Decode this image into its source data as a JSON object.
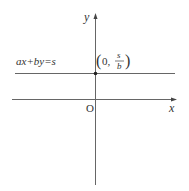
{
  "diagram": {
    "axes": {
      "x_label": "x",
      "y_label": "y",
      "origin_label": "O"
    },
    "line": {
      "equation": "ax+by=s",
      "orientation": "horizontal"
    },
    "point": {
      "open": "(0,",
      "numerator": "s",
      "denominator": "b",
      "close": ")"
    },
    "colors": {
      "axis": "#555555",
      "line": "#555555",
      "text": "#333333"
    }
  }
}
